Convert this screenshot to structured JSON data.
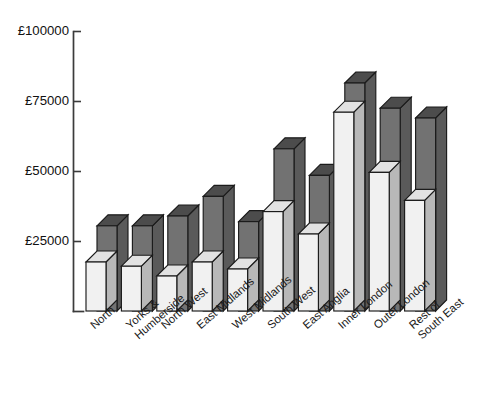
{
  "chart_data": {
    "type": "bar",
    "title": "",
    "subtitle": "",
    "xlabel": "",
    "ylabel": "",
    "currency_symbol": "£",
    "grid": false,
    "legend_position": "none",
    "ylim": [
      0,
      100000
    ],
    "ytick_values": [
      0,
      25000,
      50000,
      75000,
      100000
    ],
    "ytick_labels": [
      "",
      "£25000",
      "£50000",
      "£75000",
      "£100000"
    ],
    "axis_tick_labels_visible": [
      "£100000",
      "£75000",
      "£50000",
      "£25000"
    ],
    "categories": [
      "North",
      "Yorks &\nHumberside",
      "North West",
      "East Midlands",
      "West Midlands",
      "South West",
      "East Anglia",
      "Inner London",
      "Outer London",
      "Rest of\nSouth East"
    ],
    "category_lines": [
      [
        "North"
      ],
      [
        "Yorks &",
        "Humberside"
      ],
      [
        "North West"
      ],
      [
        "East Midlands"
      ],
      [
        "West Midlands"
      ],
      [
        "South West"
      ],
      [
        "East Anglia"
      ],
      [
        "Inner London"
      ],
      [
        "Outer London"
      ],
      [
        "Rest of",
        "South East"
      ]
    ],
    "series": [
      {
        "name": "front-light",
        "color": "#f1f1f1",
        "values": [
          17500,
          16000,
          12500,
          17500,
          15000,
          35500,
          27500,
          71000,
          49500,
          39500
        ]
      },
      {
        "name": "back-dark",
        "color": "#727272",
        "values": [
          26500,
          26500,
          30000,
          37000,
          28000,
          54000,
          44500,
          77500,
          68500,
          65000
        ]
      }
    ],
    "colors": {
      "front_face": "#f1f1f1",
      "front_top": "#e2e2e2",
      "front_side": "#b8b8b8",
      "back_face": "#727272",
      "back_top": "#4c4c4c",
      "back_side": "#5a5a5a",
      "outline": "#1b1b1b",
      "axis": "#3b3b3b",
      "background": "#ffffff"
    }
  },
  "axis": {
    "y_labels": [
      "£100000",
      "£75000",
      "£50000",
      "£25000"
    ]
  }
}
